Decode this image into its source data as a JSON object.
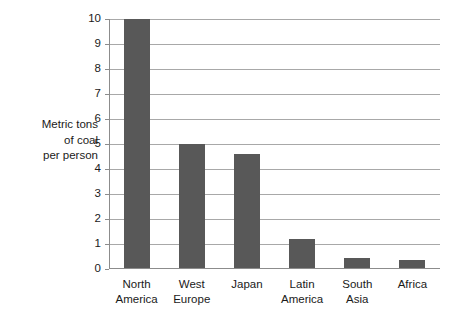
{
  "chart_data": {
    "type": "bar",
    "title": "",
    "xlabel": "",
    "ylabel": "Metric tons of coal per person",
    "ylim": [
      0,
      10
    ],
    "yticks": [
      0,
      1,
      2,
      3,
      4,
      5,
      6,
      7,
      8,
      9,
      10
    ],
    "grid": true,
    "legend": false,
    "bar_color": "#585858",
    "categories": [
      "North America",
      "West Europe",
      "Japan",
      "Latin America",
      "South Asia",
      "Africa"
    ],
    "values": [
      10,
      5,
      4.6,
      1.2,
      0.45,
      0.35
    ]
  },
  "y_axis_title_lines": [
    "Metric tons",
    "of coal",
    "per person"
  ],
  "y_tick_labels": [
    "10",
    "9",
    "8",
    "7",
    "6",
    "5",
    "4",
    "3",
    "2",
    "1",
    "0"
  ],
  "x_categories": [
    {
      "line1": "North",
      "line2": "America"
    },
    {
      "line1": "West",
      "line2": "Europe"
    },
    {
      "line1": "Japan",
      "line2": ""
    },
    {
      "line1": "Latin",
      "line2": "America"
    },
    {
      "line1": "South",
      "line2": "Asia"
    },
    {
      "line1": "Africa",
      "line2": ""
    }
  ]
}
